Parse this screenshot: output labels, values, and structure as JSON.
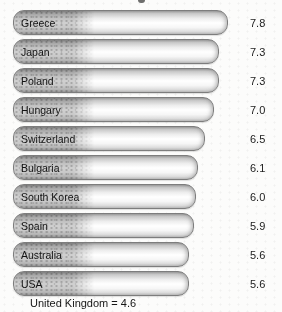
{
  "chart_data": {
    "type": "bar",
    "orientation": "horizontal",
    "categories": [
      "Greece",
      "Japan",
      "Poland",
      "Hungary",
      "Switzerland",
      "Bulgaria",
      "South Korea",
      "Spain",
      "Australia",
      "USA"
    ],
    "values": [
      7.8,
      7.3,
      7.3,
      7.0,
      6.5,
      6.1,
      6.0,
      5.9,
      5.6,
      5.6
    ],
    "value_labels": [
      "7.8",
      "7.3",
      "7.3",
      "7.0",
      "6.5",
      "6.1",
      "6.0",
      "5.9",
      "5.6",
      "5.6"
    ],
    "annotation": "United Kingdom = 4.6",
    "title": "",
    "legend": "none",
    "grid": "off",
    "value_label_position": "right-of-bar",
    "value_range_shown": [
      5.6,
      7.8
    ]
  },
  "colors": {
    "bar_border": "#7d7d7d",
    "bar_fill_light": "#ffffff",
    "bar_fill_dark": "#9c9c9c",
    "bar_texture_dots": "#8d8d8d",
    "text": "#1a1a1a",
    "background": "#fcfcfb"
  }
}
